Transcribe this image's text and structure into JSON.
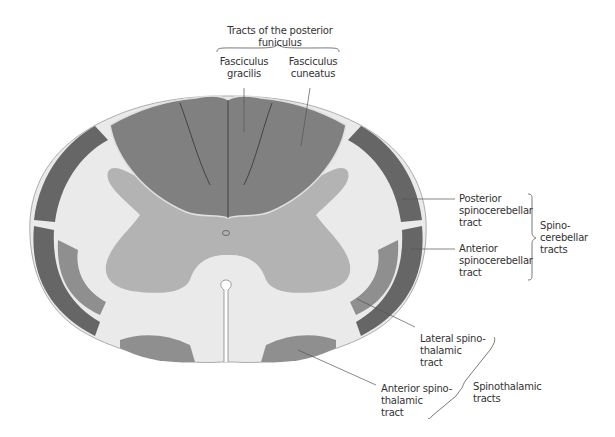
{
  "title": "Tracts of the posterior funiculus",
  "labels": {
    "fasciculus_gracilis": "Fasciculus\ngracilis",
    "fasciculus_cuneatus": "Fasciculus\ncuneatus",
    "posterior_spinocerebellar": "Posterior\nspinocerebellar\ntract",
    "anterior_spinocerebellar": "Anterior\nspinocerebellar\ntract",
    "spinocerebellar_group": "Spino-\ncerebellar\ntracts",
    "lateral_spinothalamic": "Lateral spino-\nthalamic\ntract",
    "anterior_spinothalamic": "Anterior spino-\nthalamic\ntract",
    "spinothalamic_group": "Spinothalamic\ntracts"
  },
  "colors": {
    "white_matter": "#eaeaea",
    "gray_matter": "#b3b3b3",
    "posterior_funiculus": "#808080",
    "spinocerebellar": "#666666",
    "spinothalamic": "#8f8f8f",
    "outline": "#9a9a9a",
    "leader_line": "#555555"
  }
}
